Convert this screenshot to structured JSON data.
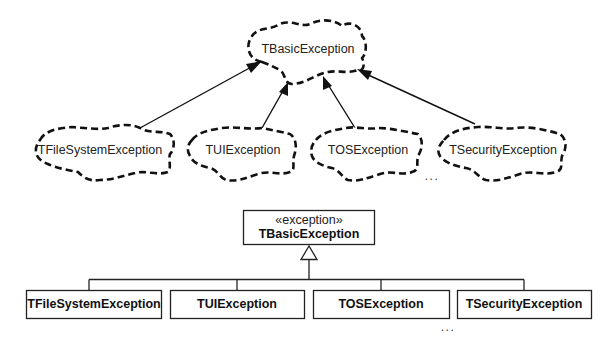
{
  "booch_diagram": {
    "base": {
      "label": "TBasicException"
    },
    "children": [
      {
        "label": "TFileSystemException"
      },
      {
        "label": "TUIException"
      },
      {
        "label": "TOSException"
      },
      {
        "label": "TSecurityException"
      }
    ],
    "ellipsis": "..."
  },
  "uml_diagram": {
    "base": {
      "stereotype": "«exception»",
      "label": "TBasicException"
    },
    "children": [
      {
        "label": "TFileSystemException"
      },
      {
        "label": "TUIException"
      },
      {
        "label": "TOSException"
      },
      {
        "label": "TSecurityException"
      }
    ],
    "ellipsis": "..."
  },
  "colors": {
    "stroke": "#111111",
    "background": "#ffffff"
  }
}
